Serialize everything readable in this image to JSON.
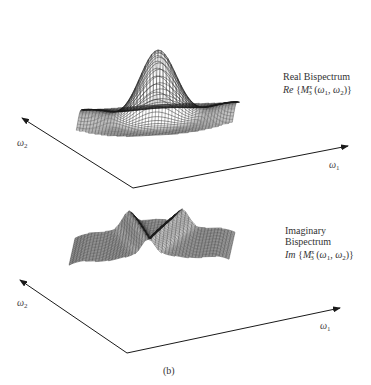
{
  "figure": {
    "caption": "(b)",
    "panels": [
      {
        "id": "real",
        "title": "Real Bispectrum",
        "formula_prefix": "Re",
        "formula_symbol": "M",
        "formula_sup": "x",
        "formula_sub": "3",
        "formula_args_1": "ω",
        "formula_args_1_sub": "1",
        "formula_args_2": "ω",
        "formula_args_2_sub": "2",
        "axis_x_label": "ω",
        "axis_x_sub": "1",
        "axis_y_label": "ω",
        "axis_y_sub": "2",
        "surface": "central peak with four lobes"
      },
      {
        "id": "imag",
        "title_line1": "Imaginary",
        "title_line2": "Bispectrum",
        "formula_prefix": "Im",
        "formula_symbol": "M",
        "formula_sup": "x",
        "formula_sub": "3",
        "formula_args_1": "ω",
        "formula_args_1_sub": "1",
        "formula_args_2": "ω",
        "formula_args_2_sub": "2",
        "axis_x_label": "ω",
        "axis_x_sub": "1",
        "axis_y_label": "ω",
        "axis_y_sub": "2",
        "surface": "antisymmetric ridged surface"
      }
    ],
    "colors": {
      "ink": "#1a1a1a",
      "background": "#ffffff"
    }
  }
}
